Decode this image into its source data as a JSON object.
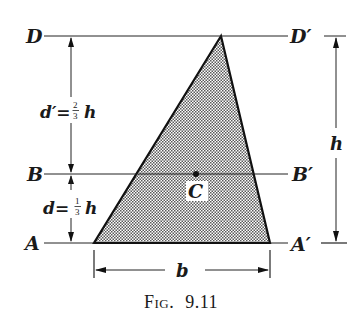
{
  "figure": {
    "caption_prefix": "Fig.",
    "caption_number": "9.11",
    "labels": {
      "D": "D",
      "D_prime": "D′",
      "B": "B",
      "B_prime": "B′",
      "A": "A",
      "A_prime": "A′",
      "C": "C",
      "h": "h",
      "b": "b"
    },
    "dimensions": {
      "d_prime_lhs": "d′=",
      "d_prime_num": "2",
      "d_prime_den": "3",
      "d_prime_var": "h",
      "d_lhs": "d=",
      "d_num": "1",
      "d_den": "3",
      "d_var": "h"
    },
    "colors": {
      "ink": "#1a1a1a",
      "shade": "#b5b5b5"
    }
  }
}
